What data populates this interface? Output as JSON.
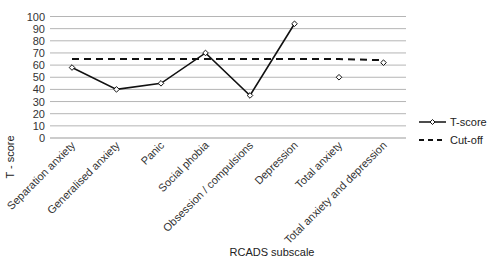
{
  "chart_data": {
    "type": "line",
    "title": "",
    "xlabel": "RCADS subscale",
    "ylabel": "T - score",
    "ylim": [
      0,
      100
    ],
    "yticks": [
      0,
      10,
      20,
      30,
      40,
      50,
      60,
      70,
      80,
      90,
      100
    ],
    "grid": true,
    "legend_position": "right",
    "categories": [
      "Separation anxiety",
      "Generalised anxiety",
      "Panic",
      "Social phobia",
      "Obsession / compulsions",
      "Depression",
      "Total anxiety",
      "Total anxiety and depression"
    ],
    "series": [
      {
        "name": "T-score",
        "style": "solid line with open diamond markers",
        "values": [
          58,
          40,
          45,
          70,
          35,
          94,
          50,
          62
        ],
        "connected_through_index": 5
      },
      {
        "name": "Cut-off",
        "style": "dashed line",
        "values": [
          65,
          65,
          65,
          65,
          65,
          65,
          65,
          64
        ]
      }
    ],
    "colors": {
      "line": "#111111",
      "grid": "#b5b5b5",
      "text": "#333333"
    }
  }
}
